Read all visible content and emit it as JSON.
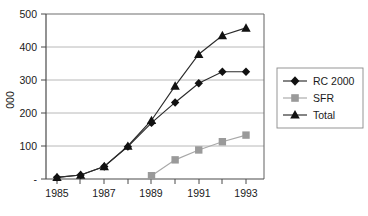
{
  "chart_data": {
    "type": "line",
    "title": "",
    "xlabel": "",
    "ylabel": "000",
    "x": [
      1985,
      1986,
      1987,
      1988,
      1989,
      1990,
      1991,
      1992,
      1993
    ],
    "xtick_labels": [
      "1985",
      "1987",
      "1989",
      "1991",
      "1993"
    ],
    "xtick_values": [
      1985,
      1987,
      1989,
      1991,
      1993
    ],
    "xlim": [
      1984.5,
      1993.8
    ],
    "ytick_labels": [
      "-",
      "100",
      "200",
      "300",
      "400",
      "500"
    ],
    "ytick_values": [
      0,
      100,
      200,
      300,
      400,
      500
    ],
    "ylim": [
      0,
      500
    ],
    "grid": true,
    "legend_position": "right",
    "series": [
      {
        "name": "RC 2000",
        "marker": "diamond",
        "color": "#111111",
        "line_color": "#2b2b2b",
        "x": [
          1985,
          1986,
          1987,
          1988,
          1989,
          1990,
          1991,
          1992,
          1993
        ],
        "values": [
          5,
          12,
          38,
          98,
          170,
          232,
          290,
          325,
          325
        ]
      },
      {
        "name": "SFR",
        "marker": "square",
        "color": "#9a9a9a",
        "line_color": "#a8a8a8",
        "x": [
          1989,
          1990,
          1991,
          1992,
          1993
        ],
        "values": [
          10,
          58,
          88,
          113,
          133
        ]
      },
      {
        "name": "Total",
        "marker": "triangle",
        "color": "#111111",
        "line_color": "#2b2b2b",
        "x": [
          1985,
          1986,
          1987,
          1988,
          1989,
          1990,
          1991,
          1992,
          1993
        ],
        "values": [
          5,
          12,
          38,
          100,
          178,
          282,
          378,
          435,
          458
        ]
      }
    ]
  },
  "legend": {
    "items": [
      {
        "label": "RC 2000",
        "marker": "diamond-marker-icon"
      },
      {
        "label": "SFR",
        "marker": "square-marker-icon"
      },
      {
        "label": "Total",
        "marker": "triangle-marker-icon"
      }
    ]
  },
  "axes": {
    "y_axis_title": "000",
    "y_tick_0": "-",
    "y_tick_100": "100",
    "y_tick_200": "200",
    "y_tick_300": "300",
    "y_tick_400": "400",
    "y_tick_500": "500",
    "x_tick_1985": "1985",
    "x_tick_1987": "1987",
    "x_tick_1989": "1989",
    "x_tick_1991": "1991",
    "x_tick_1993": "1993"
  },
  "colors": {
    "grid": "#b0b0b0",
    "frame": "#6f6f6f",
    "dark_series": "#111111",
    "gray_series": "#9a9a9a",
    "text": "#1a1a1a",
    "background": "#ffffff"
  }
}
